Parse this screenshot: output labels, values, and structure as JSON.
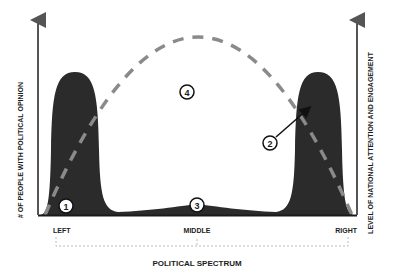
{
  "diagram": {
    "left_axis_label": "# OF PEOPLE WITH POLITICAL OPINION",
    "right_axis_label": "LEVEL OF NATIONAL ATTENTION AND ENGAGEMENT",
    "x_axis_title": "POLITICAL SPECTRUM",
    "x_ticks": {
      "left": "LEFT",
      "middle": "MIDDLE",
      "right": "RIGHT"
    },
    "markers": {
      "m1": "1",
      "m2": "2",
      "m3": "3",
      "m4": "4"
    },
    "colors": {
      "distribution_fill": "#2b2b2b",
      "attention_curve": "#8a8a8a",
      "axis": "#555555",
      "background": "#ffffff"
    },
    "series": [
      {
        "name": "# of people with political opinion",
        "style": "filled area",
        "shape": "bimodal: tall peaks at left and right, small bump in middle"
      },
      {
        "name": "Level of national attention and engagement",
        "style": "dashed line",
        "shape": "inverted parabola peaking at middle"
      }
    ]
  }
}
